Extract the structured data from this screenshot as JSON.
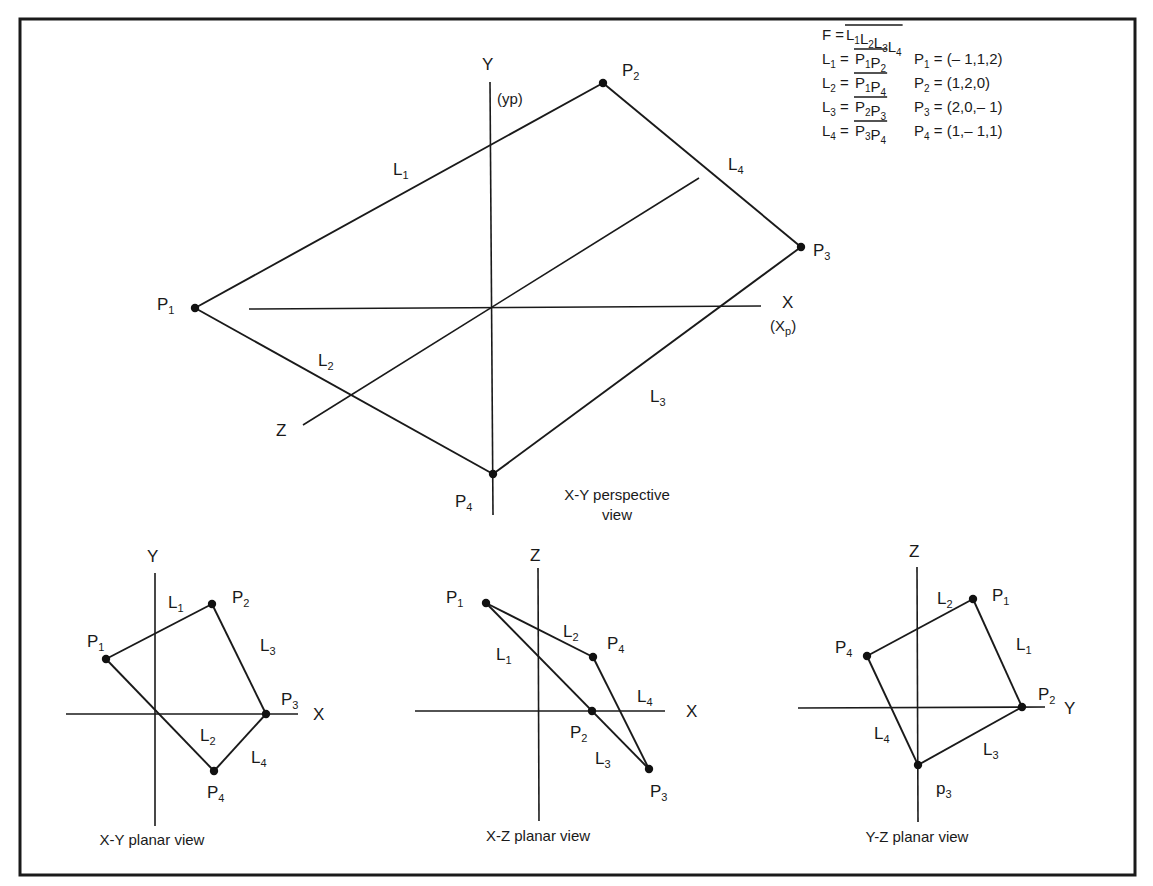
{
  "frame": {
    "x1": 20,
    "y1": 19,
    "x2": 1135,
    "y2": 875
  },
  "legend": {
    "x": 822,
    "y": 40,
    "line_height": 24,
    "face": {
      "lhs": "F",
      "terms": [
        [
          "L",
          "1"
        ],
        [
          "L",
          "2"
        ],
        [
          "L",
          "3"
        ],
        [
          "L",
          "4"
        ]
      ]
    },
    "rows": [
      {
        "lhs": [
          "L",
          "1"
        ],
        "rhs": [
          [
            "P",
            "1"
          ],
          [
            "P",
            "2"
          ]
        ],
        "point": [
          "P",
          "1"
        ],
        "coords": "(– 1,1,2)"
      },
      {
        "lhs": [
          "L",
          "2"
        ],
        "rhs": [
          [
            "P",
            "1"
          ],
          [
            "P",
            "4"
          ]
        ],
        "point": [
          "P",
          "2"
        ],
        "coords": "(1,2,0)"
      },
      {
        "lhs": [
          "L",
          "3"
        ],
        "rhs": [
          [
            "P",
            "2"
          ],
          [
            "P",
            "3"
          ]
        ],
        "point": [
          "P",
          "3"
        ],
        "coords": "(2,0,– 1)"
      },
      {
        "lhs": [
          "L",
          "4"
        ],
        "rhs": [
          [
            "P",
            "3"
          ],
          [
            "P",
            "4"
          ]
        ],
        "point": [
          "P",
          "4"
        ],
        "coords": "(1,– 1,1)"
      }
    ]
  },
  "views": [
    {
      "id": "perspective",
      "caption": [
        "X-Y perspective",
        "view"
      ],
      "caption_pos": [
        617,
        500
      ],
      "axes": [
        {
          "name": "Y",
          "x1": 490,
          "y1": 82,
          "x2": 493,
          "y2": 515,
          "label": "Y",
          "lx": 482,
          "ly": 70,
          "extra": "(yp)",
          "ex": 497,
          "ey": 104
        },
        {
          "name": "X",
          "x1": 249,
          "y1": 309,
          "x2": 761,
          "y2": 306,
          "label": "X",
          "lx": 782,
          "ly": 308,
          "extra": "(Xp)",
          "ex": 770,
          "ey": 331
        },
        {
          "name": "Z",
          "x1": 303,
          "y1": 425,
          "x2": 699,
          "y2": 178,
          "label": "Z",
          "lx": 276,
          "ly": 436
        }
      ],
      "points": [
        {
          "name": "P",
          "sub": "1",
          "x": 195,
          "y": 308,
          "lx": 157,
          "ly": 310
        },
        {
          "name": "P",
          "sub": "2",
          "x": 603,
          "y": 83,
          "lx": 622,
          "ly": 76
        },
        {
          "name": "P",
          "sub": "3",
          "x": 801,
          "y": 247,
          "lx": 813,
          "ly": 256
        },
        {
          "name": "P",
          "sub": "4",
          "x": 493,
          "y": 474,
          "lx": 455,
          "ly": 507
        }
      ],
      "edges": [
        [
          0,
          1
        ],
        [
          1,
          2
        ],
        [
          2,
          3
        ],
        [
          3,
          0
        ]
      ],
      "edge_labels": [
        {
          "name": "L",
          "sub": "1",
          "x": 393,
          "y": 175
        },
        {
          "name": "L",
          "sub": "4",
          "x": 728,
          "y": 170
        },
        {
          "name": "L",
          "sub": "2",
          "x": 318,
          "y": 366
        },
        {
          "name": "L",
          "sub": "3",
          "x": 650,
          "y": 402
        }
      ]
    },
    {
      "id": "xy-planar",
      "caption": [
        "X-Y planar view"
      ],
      "caption_pos": [
        152,
        845
      ],
      "axes": [
        {
          "name": "Y",
          "x1": 155,
          "y1": 573,
          "x2": 155,
          "y2": 826,
          "label": "Y",
          "lx": 147,
          "ly": 562
        },
        {
          "name": "X",
          "x1": 66,
          "y1": 714,
          "x2": 298,
          "y2": 714,
          "label": "X",
          "lx": 313,
          "ly": 720
        }
      ],
      "points": [
        {
          "name": "P",
          "sub": "1",
          "x": 106,
          "y": 659,
          "lx": 87,
          "ly": 647
        },
        {
          "name": "P",
          "sub": "2",
          "x": 212,
          "y": 604,
          "lx": 232,
          "ly": 603
        },
        {
          "name": "P",
          "sub": "3",
          "x": 266,
          "y": 714,
          "lx": 281,
          "ly": 705
        },
        {
          "name": "P",
          "sub": "4",
          "x": 214,
          "y": 771,
          "lx": 207,
          "ly": 798
        }
      ],
      "edges": [
        [
          0,
          1
        ],
        [
          1,
          2
        ],
        [
          2,
          3
        ],
        [
          3,
          0
        ]
      ],
      "edge_labels": [
        {
          "name": "L",
          "sub": "1",
          "x": 168,
          "y": 608
        },
        {
          "name": "L",
          "sub": "3",
          "x": 260,
          "y": 651
        },
        {
          "name": "L",
          "sub": "2",
          "x": 200,
          "y": 741
        },
        {
          "name": "L",
          "sub": "4",
          "x": 251,
          "y": 763
        }
      ]
    },
    {
      "id": "xz-planar",
      "caption": [
        "X-Z planar view"
      ],
      "caption_pos": [
        538,
        841
      ],
      "axes": [
        {
          "name": "Z",
          "x1": 538,
          "y1": 568,
          "x2": 539,
          "y2": 821,
          "label": "Z",
          "lx": 530,
          "ly": 561
        },
        {
          "name": "X",
          "x1": 415,
          "y1": 711,
          "x2": 665,
          "y2": 711,
          "label": "X",
          "lx": 686,
          "ly": 717
        }
      ],
      "points": [
        {
          "name": "P",
          "sub": "1",
          "x": 486,
          "y": 603,
          "lx": 446,
          "ly": 603
        },
        {
          "name": "P",
          "sub": "2",
          "x": 592,
          "y": 711,
          "lx": 570,
          "ly": 738
        },
        {
          "name": "P",
          "sub": "3",
          "x": 649,
          "y": 769,
          "lx": 650,
          "ly": 797
        },
        {
          "name": "P",
          "sub": "4",
          "x": 593,
          "y": 657,
          "lx": 607,
          "ly": 649
        }
      ],
      "edges": [
        [
          0,
          2
        ],
        [
          0,
          3
        ],
        [
          3,
          2
        ]
      ],
      "edge_labels": [
        {
          "name": "L",
          "sub": "2",
          "x": 563,
          "y": 637
        },
        {
          "name": "L",
          "sub": "1",
          "x": 496,
          "y": 660
        },
        {
          "name": "L",
          "sub": "4",
          "x": 637,
          "y": 702
        },
        {
          "name": "L",
          "sub": "3",
          "x": 595,
          "y": 764
        }
      ]
    },
    {
      "id": "yz-planar",
      "caption": [
        "Y-Z planar view"
      ],
      "caption_pos": [
        917,
        842
      ],
      "axes": [
        {
          "name": "Z",
          "x1": 917,
          "y1": 567,
          "x2": 918,
          "y2": 822,
          "label": "Z",
          "lx": 909,
          "ly": 557
        },
        {
          "name": "Y",
          "x1": 798,
          "y1": 708,
          "x2": 1045,
          "y2": 707,
          "label": "Y",
          "lx": 1064,
          "ly": 714
        }
      ],
      "points": [
        {
          "name": "P",
          "sub": "1",
          "x": 973,
          "y": 599,
          "lx": 992,
          "ly": 601
        },
        {
          "name": "P",
          "sub": "2",
          "x": 1022,
          "y": 707,
          "lx": 1038,
          "ly": 700
        },
        {
          "name": "p",
          "sub": "3",
          "x": 918,
          "y": 765,
          "lx": 936,
          "ly": 794
        },
        {
          "name": "P",
          "sub": "4",
          "x": 867,
          "y": 656,
          "lx": 835,
          "ly": 653
        }
      ],
      "edges": [
        [
          3,
          0
        ],
        [
          0,
          1
        ],
        [
          1,
          2
        ],
        [
          2,
          3
        ]
      ],
      "edge_labels": [
        {
          "name": "L",
          "sub": "2",
          "x": 937,
          "y": 604
        },
        {
          "name": "L",
          "sub": "1",
          "x": 1016,
          "y": 650
        },
        {
          "name": "L",
          "sub": "4",
          "x": 874,
          "y": 739
        },
        {
          "name": "L",
          "sub": "3",
          "x": 983,
          "y": 755
        }
      ]
    }
  ]
}
